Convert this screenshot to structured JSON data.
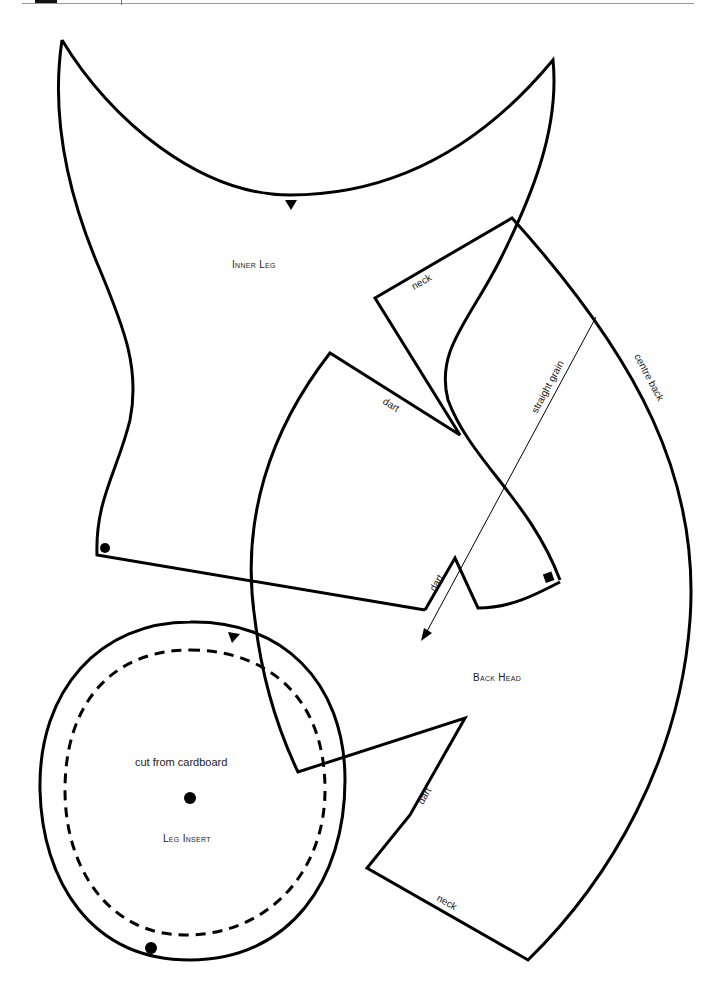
{
  "header": {
    "rule_color": "#9a9a9a",
    "block_color": "#111111"
  },
  "pieces": {
    "inner_leg": {
      "title": "Inner Leg"
    },
    "back_head": {
      "title": "Back Head",
      "edges": {
        "neck_top": "neck",
        "dart_upper": "dart",
        "dart_middle": "dart",
        "dart_lower": "dart",
        "neck_bottom": "neck",
        "centre_back": "centre back",
        "grainline": "straight grain"
      }
    },
    "leg_insert": {
      "title": "Leg Insert",
      "note": "cut from cardboard"
    }
  },
  "markers": {
    "notch": "triangle",
    "match_point": "dot",
    "corner_mark": "square"
  },
  "colors": {
    "line": "#000000",
    "text": "#222222",
    "background": "#ffffff"
  }
}
